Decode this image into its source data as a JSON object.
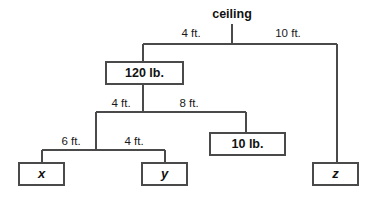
{
  "diagram": {
    "type": "hanging-mobile-balance",
    "title": "",
    "anchor": {
      "id": "ceiling",
      "label": "ceiling",
      "x": 232,
      "y": 15,
      "drop_from_y": 24,
      "drop_to_y": 44
    },
    "colors": {
      "line": "#4a4a4a",
      "box_fill": "#ffffff",
      "box_stroke": "#4a4a4a",
      "text": "#111111",
      "background": "#ffffff"
    },
    "bars": [
      {
        "id": "bar-tier-1",
        "name": "ceiling-bar",
        "y": 44,
        "x_left": 143,
        "x_right": 337,
        "pivot_x": 232,
        "drop_left_to_y": 62,
        "drop_right_to_y": 163
      },
      {
        "id": "bar-tier-2",
        "name": "beam-under-120lb",
        "y": 112,
        "x_left": 96,
        "x_right": 246,
        "pivot_x": 143,
        "drop_left_to_y": 150,
        "drop_right_to_y": 133
      },
      {
        "id": "bar-tier-3",
        "name": "beam-above-x-y",
        "y": 150,
        "x_left": 42,
        "x_right": 165,
        "pivot_x": 96,
        "drop_left_to_y": 163,
        "drop_right_to_y": 163
      }
    ],
    "connectors": [
      {
        "id": "stem-120lb",
        "x": 143,
        "y_from": 44,
        "y_to": 62
      },
      {
        "id": "stem-120lb-down",
        "x": 143,
        "y_from": 84,
        "y_to": 112
      },
      {
        "id": "stem-z",
        "x": 337,
        "y_from": 44,
        "y_to": 163
      },
      {
        "id": "stem-10lb",
        "x": 246,
        "y_from": 112,
        "y_to": 133
      },
      {
        "id": "stem-tier3",
        "x": 96,
        "y_from": 112,
        "y_to": 150
      },
      {
        "id": "stem-x",
        "x": 42,
        "y_from": 150,
        "y_to": 163
      },
      {
        "id": "stem-y",
        "x": 165,
        "y_from": 150,
        "y_to": 163
      }
    ],
    "length_labels": [
      {
        "id": "len-ceiling-left",
        "text": "4 ft.",
        "x": 191,
        "y": 34,
        "segment": "ceiling-pivot-to-120lb-stem"
      },
      {
        "id": "len-ceiling-right",
        "text": "10 ft.",
        "x": 288,
        "y": 34,
        "segment": "ceiling-pivot-to-z-stem"
      },
      {
        "id": "len-tier2-left",
        "text": "4 ft.",
        "x": 121,
        "y": 104,
        "segment": "120lb-stem-to-tier3-stem"
      },
      {
        "id": "len-tier2-right",
        "text": "8 ft.",
        "x": 189,
        "y": 104,
        "segment": "120lb-stem-to-10lb-stem"
      },
      {
        "id": "len-tier3-left",
        "text": "6 ft.",
        "x": 71,
        "y": 142,
        "segment": "tier3-pivot-to-x"
      },
      {
        "id": "len-tier3-right",
        "text": "4 ft.",
        "x": 134,
        "y": 142,
        "segment": "tier3-pivot-to-y"
      }
    ],
    "nodes": [
      {
        "id": "node-120lb",
        "label": "120 lb.",
        "kind": "weight",
        "italic": false,
        "x": 106,
        "y": 62,
        "width": 77,
        "height": 22
      },
      {
        "id": "node-10lb",
        "label": "10 lb.",
        "kind": "weight",
        "italic": false,
        "x": 210,
        "y": 133,
        "width": 75,
        "height": 22
      },
      {
        "id": "node-x",
        "label": "x",
        "kind": "variable",
        "italic": true,
        "x": 19,
        "y": 163,
        "width": 45,
        "height": 22
      },
      {
        "id": "node-y",
        "label": "y",
        "kind": "variable",
        "italic": true,
        "x": 142,
        "y": 163,
        "width": 45,
        "height": 22
      },
      {
        "id": "node-z",
        "label": "z",
        "kind": "variable",
        "italic": true,
        "x": 313,
        "y": 163,
        "width": 45,
        "height": 22
      }
    ]
  }
}
